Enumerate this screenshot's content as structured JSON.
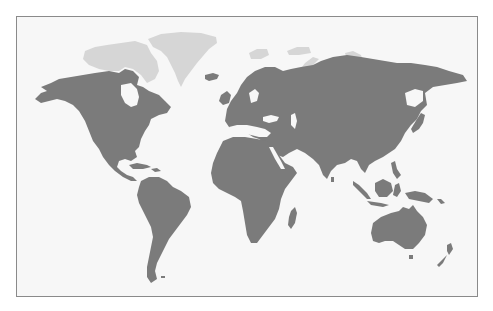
{
  "map": {
    "type": "world-map",
    "projection": "Miller / equirectangular style",
    "colors": {
      "background": "#f7f7f7",
      "land": "#7b7b7b",
      "arctic_land": "#d6d6d6",
      "border": "#8a8a8a"
    },
    "highlighted_regions": [
      "North America",
      "South America",
      "Europe",
      "Africa",
      "Asia",
      "Australia",
      "New Zealand",
      "Madagascar",
      "Iceland",
      "Japan",
      "Indonesia",
      "Philippines",
      "Papua New Guinea",
      "Caribbean",
      "British Isles",
      "Sri Lanka"
    ],
    "light_regions": [
      "Greenland",
      "Canadian Arctic Archipelago",
      "Svalbard",
      "Franz Josef Land",
      "Novaya Zemlya",
      "Severnaya Zemlya",
      "New Siberian Islands"
    ]
  }
}
